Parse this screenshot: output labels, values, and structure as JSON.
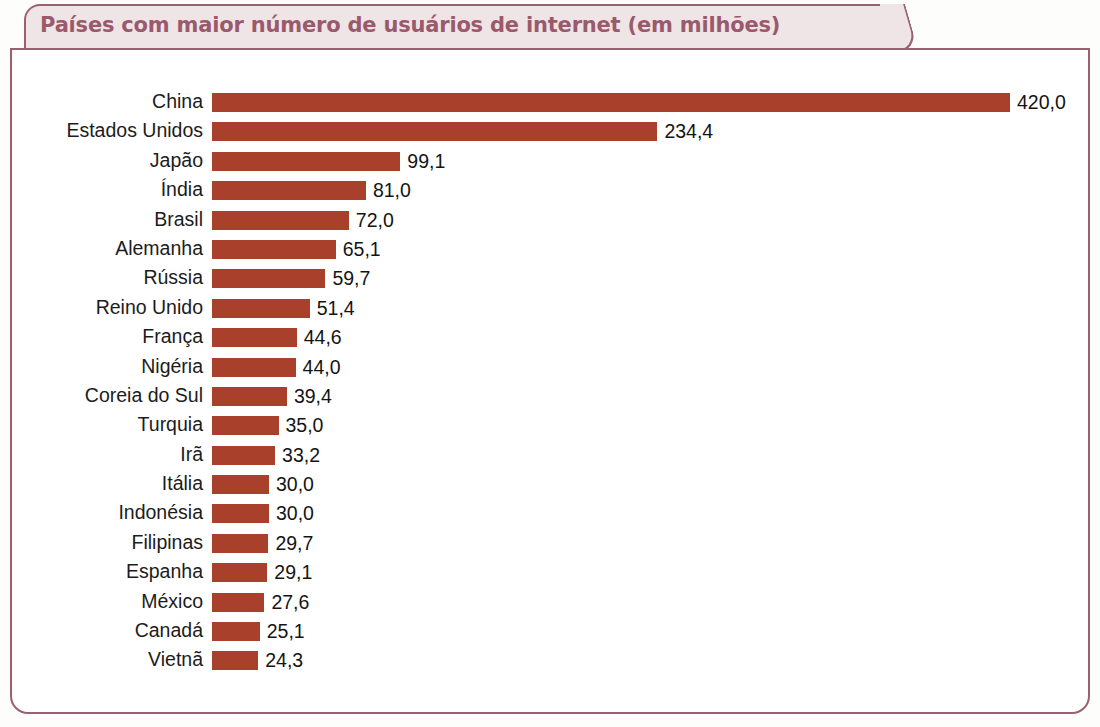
{
  "chart_data": {
    "type": "bar",
    "orientation": "horizontal",
    "title": "Países com maior número de usuários de internet (em milhões)",
    "xlabel": "",
    "ylabel": "",
    "unit": "milhões",
    "grid": false,
    "legend": null,
    "xlim": [
      0,
      420
    ],
    "value_format": "comma-decimal",
    "bar_color": "#a8402c",
    "categories": [
      "China",
      "Estados Unidos",
      "Japão",
      "Índia",
      "Brasil",
      "Alemanha",
      "Rússia",
      "Reino Unido",
      "França",
      "Nigéria",
      "Coreia do Sul",
      "Turquia",
      "Irã",
      "Itália",
      "Indonésia",
      "Filipinas",
      "Espanha",
      "México",
      "Canadá",
      "Vietnã"
    ],
    "values": [
      420.0,
      234.4,
      99.1,
      81.0,
      72.0,
      65.1,
      59.7,
      51.4,
      44.6,
      44.0,
      39.4,
      35.0,
      33.2,
      30.0,
      30.0,
      29.7,
      29.1,
      27.6,
      25.1,
      24.3
    ],
    "value_labels": [
      "420,0",
      "234,4",
      "99,1",
      "81,0",
      "72,0",
      "65,1",
      "59,7",
      "51,4",
      "44,6",
      "44,0",
      "39,4",
      "35,0",
      "33,2",
      "30,0",
      "30,0",
      "29,7",
      "29,1",
      "27,6",
      "25,1",
      "24,3"
    ],
    "rows": [
      {
        "category": "China",
        "value": 420.0,
        "value_label": "420,0"
      },
      {
        "category": "Estados Unidos",
        "value": 234.4,
        "value_label": "234,4"
      },
      {
        "category": "Japão",
        "value": 99.1,
        "value_label": "99,1"
      },
      {
        "category": "Índia",
        "value": 81.0,
        "value_label": "81,0"
      },
      {
        "category": "Brasil",
        "value": 72.0,
        "value_label": "72,0"
      },
      {
        "category": "Alemanha",
        "value": 65.1,
        "value_label": "65,1"
      },
      {
        "category": "Rússia",
        "value": 59.7,
        "value_label": "59,7"
      },
      {
        "category": "Reino Unido",
        "value": 51.4,
        "value_label": "51,4"
      },
      {
        "category": "França",
        "value": 44.6,
        "value_label": "44,6"
      },
      {
        "category": "Nigéria",
        "value": 44.0,
        "value_label": "44,0"
      },
      {
        "category": "Coreia do Sul",
        "value": 39.4,
        "value_label": "39,4"
      },
      {
        "category": "Turquia",
        "value": 35.0,
        "value_label": "35,0"
      },
      {
        "category": "Irã",
        "value": 33.2,
        "value_label": "33,2"
      },
      {
        "category": "Itália",
        "value": 30.0,
        "value_label": "30,0"
      },
      {
        "category": "Indonésia",
        "value": 30.0,
        "value_label": "30,0"
      },
      {
        "category": "Filipinas",
        "value": 29.7,
        "value_label": "29,7"
      },
      {
        "category": "Espanha",
        "value": 29.1,
        "value_label": "29,1"
      },
      {
        "category": "México",
        "value": 27.6,
        "value_label": "27,6"
      },
      {
        "category": "Canadá",
        "value": 25.1,
        "value_label": "25,1"
      },
      {
        "category": "Vietnã",
        "value": 24.3,
        "value_label": "24,3"
      }
    ]
  },
  "style": {
    "frame_color": "#9b6070",
    "title_color": "#9b5a6b",
    "title_band_fill": "#efe5e7",
    "label_color": "#1c1c1c"
  }
}
